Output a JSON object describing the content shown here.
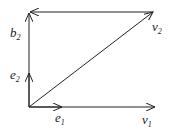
{
  "diagram": {
    "labels": {
      "b2": {
        "base": "b",
        "sub": "2"
      },
      "e2": {
        "base": "e",
        "sub": "2"
      },
      "e1": {
        "base": "e",
        "sub": "1"
      },
      "v1": {
        "base": "v",
        "sub": "1"
      },
      "v2": {
        "base": "v",
        "sub": "2"
      }
    },
    "colors": {
      "stroke": "#222222"
    }
  }
}
